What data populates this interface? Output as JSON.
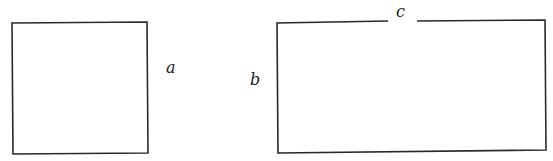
{
  "diagram": {
    "square": {
      "label": "a"
    },
    "rectangle": {
      "side_label": "b",
      "top_label": "c"
    }
  }
}
